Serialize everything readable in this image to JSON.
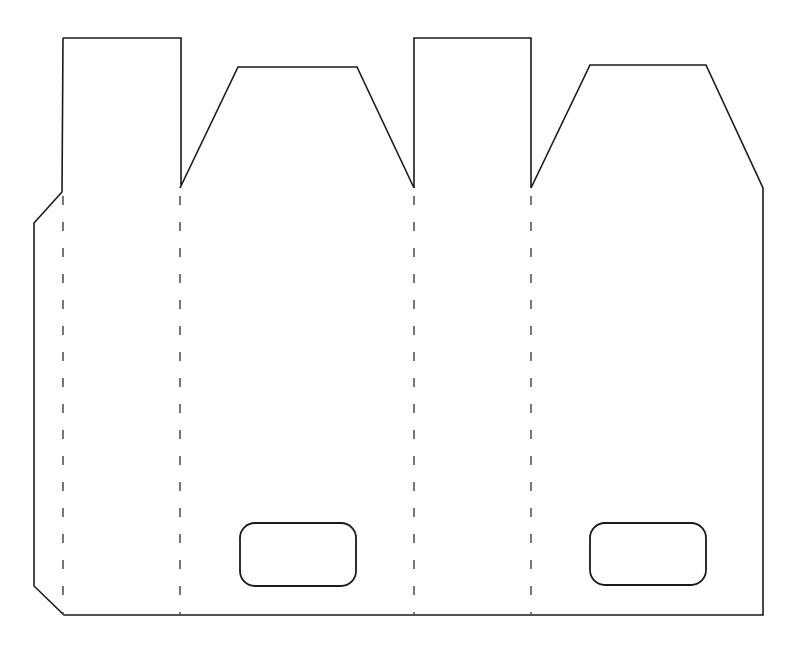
{
  "document": {
    "title": "Box Die-Cut Template",
    "description": "Flat unfolded carton / bag net drawing with cut outline, fold lines and two handle cut-outs",
    "canvas": {
      "width": 794,
      "height": 645
    },
    "background_color": "#ffffff"
  },
  "style": {
    "cut_line_color": "#1a1a1a",
    "cut_line_width": 1.6,
    "fold_line_color": "#555555",
    "fold_line_width": 1.6,
    "fold_dash_pattern": "9 17",
    "handle_line_color": "#1a1a1a",
    "handle_line_width": 1.8
  },
  "geometry": {
    "outline_label": "cut-outline",
    "outline_points": "63,38 181,38 181,186 180,188 238,67 357,67 414,188 414,38 531,38 531,188 590,65 706,65 763,188 763,615 64,615 34,586 34,223 62,192 63,38",
    "fold_lines": [
      {
        "name": "fold-line-1",
        "x": 63,
        "y1": 196,
        "y2": 615
      },
      {
        "name": "fold-line-2",
        "x": 180,
        "y1": 196,
        "y2": 615
      },
      {
        "name": "fold-line-3",
        "x": 414,
        "y1": 196,
        "y2": 615
      },
      {
        "name": "fold-line-4",
        "x": 531,
        "y1": 196,
        "y2": 615
      }
    ],
    "handles": [
      {
        "name": "handle-cutout-left",
        "x": 240,
        "y": 523,
        "width": 116,
        "height": 63,
        "radius": 15
      },
      {
        "name": "handle-cutout-right",
        "x": 590,
        "y": 523,
        "width": 116,
        "height": 62,
        "radius": 15
      }
    ],
    "panels": [
      {
        "name": "glue-flap-panel",
        "description": "narrow left glue tab with angled top and bottom corners"
      },
      {
        "name": "side-panel-left",
        "description": "tall rectangular tab panel, leftmost flap"
      },
      {
        "name": "front-panel",
        "description": "wide panel with trapezoid top flap and handle cut-out"
      },
      {
        "name": "side-panel-right",
        "description": "tall rectangular tab panel, center flap"
      },
      {
        "name": "back-panel",
        "description": "wide panel with trapezoid top flap, handle cut-out and angled right corner"
      }
    ]
  }
}
